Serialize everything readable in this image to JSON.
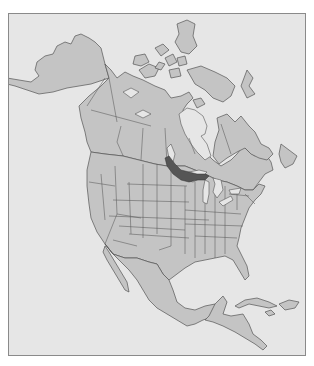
{
  "map": {
    "title": "",
    "region": "North America",
    "style": "grayscale political outline map",
    "colors": {
      "background": "#e6e6e6",
      "land": "#c4c4c4",
      "borders": "#555555",
      "highlight": "#555555",
      "frame": "#8a8a8a"
    },
    "highlighted_area": {
      "description": "dark band running from southeastern Manitoba / northwestern Ontario across northern Minnesota and Wisconsin to Michigan's Upper Peninsula",
      "color": "#555555"
    },
    "countries_shown": [
      "Canada",
      "United States",
      "Mexico",
      "Central America",
      "Caribbean islands",
      "Greenland (edge)"
    ],
    "labels": []
  }
}
